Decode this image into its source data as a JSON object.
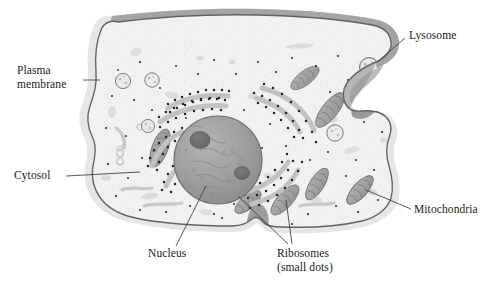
{
  "figure": {
    "type": "biological-diagram",
    "background_color": "#ffffff"
  },
  "labels": {
    "plasma_membrane": "Plasma\nmembrane",
    "cytosol": "Cytosol",
    "nucleus": "Nucleus",
    "ribosomes": "Ribosomes\n(small dots)",
    "lysosome": "Lysosome",
    "mitochondria": "Mitochondria"
  },
  "structures": [
    {
      "name": "plasma-membrane",
      "label": "Plasma membrane",
      "description": "Outer boundary of the cell drawn as a thin dark outline with a pale gray halo"
    },
    {
      "name": "cytosol",
      "label": "Cytosol",
      "description": "Pale gray stippled interior fluid filling the cell"
    },
    {
      "name": "nucleus",
      "label": "Nucleus",
      "description": "Large central gray sphere containing two darker nucleoli"
    },
    {
      "name": "ribosomes",
      "label": "Ribosomes (small dots)",
      "description": "Black dots studding the endoplasmic reticulum sheets and scattered in the cytosol"
    },
    {
      "name": "lysosome",
      "label": "Lysosome",
      "description": "Small round vesicles with speckled interiors"
    },
    {
      "name": "mitochondria",
      "label": "Mitochondria",
      "description": "Elongated gray ovals with internal cristae folds"
    }
  ],
  "colors": {
    "outline": "#6b6b6b",
    "cytosol_fill": "#f0f0f0",
    "halo": "#e3e3e3",
    "nucleus_fill": "#9c9c9c",
    "nucleolus": "#6f6f6f",
    "mitochondria_fill": "#a8a8a8",
    "er_sheet": "#c4c4c4",
    "ribosome_dot": "#2b2b2b",
    "label_text": "#1a1a1a",
    "leader_line": "#3a3a3a"
  },
  "counts": {
    "mitochondria": 7,
    "lysosomes": 5,
    "nucleoli": 2,
    "er_sheets": 8
  }
}
